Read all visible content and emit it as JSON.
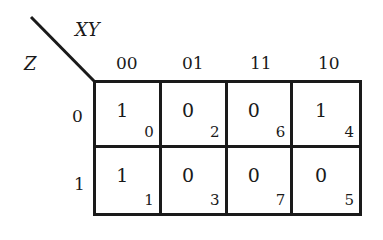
{
  "kmap": {
    "row_var": "Z",
    "col_vars": "XY",
    "col_headers": [
      "00",
      "01",
      "11",
      "10"
    ],
    "row_headers": [
      "0",
      "1"
    ],
    "rows": [
      [
        {
          "value": "1",
          "index": "0"
        },
        {
          "value": "0",
          "index": "2"
        },
        {
          "value": "0",
          "index": "6"
        },
        {
          "value": "1",
          "index": "4"
        }
      ],
      [
        {
          "value": "1",
          "index": "1"
        },
        {
          "value": "0",
          "index": "3"
        },
        {
          "value": "0",
          "index": "7"
        },
        {
          "value": "0",
          "index": "5"
        }
      ]
    ]
  }
}
